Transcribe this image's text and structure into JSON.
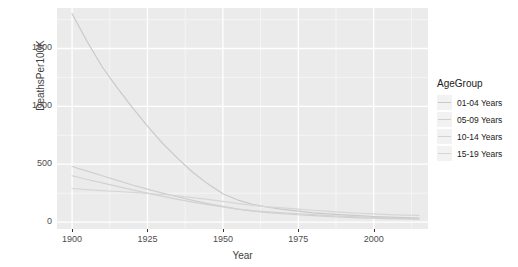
{
  "chart_data": {
    "type": "line",
    "title": "",
    "xlabel": "Year",
    "ylabel": "DeathsPer100K",
    "xlim": [
      1895,
      2018
    ],
    "ylim": [
      -60,
      1850
    ],
    "grid": true,
    "legend_position": "right",
    "legend_title": "AgeGroup",
    "xticks": [
      1900,
      1925,
      1950,
      1975,
      2000
    ],
    "yticks": [
      0,
      500,
      1000,
      1500
    ],
    "x": [
      1900,
      1905,
      1910,
      1915,
      1920,
      1925,
      1930,
      1935,
      1940,
      1945,
      1950,
      1955,
      1960,
      1965,
      1970,
      1975,
      1980,
      1985,
      1990,
      1995,
      2000,
      2005,
      2010,
      2015
    ],
    "series": [
      {
        "name": "01-04 Years",
        "color": "#c9c9c9",
        "values": [
          1800,
          1560,
          1340,
          1160,
          990,
          830,
          680,
          550,
          430,
          330,
          245,
          190,
          152,
          128,
          110,
          95,
          80,
          70,
          62,
          55,
          48,
          42,
          38,
          35
        ]
      },
      {
        "name": "05-09 Years",
        "color": "#cfcfcf",
        "values": [
          480,
          440,
          400,
          360,
          320,
          285,
          250,
          218,
          188,
          160,
          135,
          112,
          95,
          82,
          72,
          63,
          55,
          48,
          42,
          37,
          33,
          30,
          27,
          25
        ]
      },
      {
        "name": "10-14 Years",
        "color": "#d2d2d2",
        "values": [
          400,
          368,
          338,
          308,
          278,
          250,
          222,
          196,
          172,
          150,
          130,
          112,
          98,
          88,
          80,
          72,
          64,
          56,
          50,
          44,
          40,
          36,
          33,
          30
        ]
      },
      {
        "name": "15-19 Years",
        "color": "#d6d6d6",
        "values": [
          290,
          280,
          272,
          264,
          256,
          248,
          238,
          226,
          212,
          196,
          178,
          160,
          144,
          132,
          122,
          112,
          102,
          92,
          84,
          76,
          70,
          65,
          60,
          57
        ]
      }
    ]
  },
  "axis": {
    "y_title": "DeathsPer100K",
    "x_title": "Year",
    "y_tick_labels": [
      "1500",
      "1000",
      "500",
      "0"
    ],
    "x_tick_labels": [
      "1900",
      "1925",
      "1950",
      "1975",
      "2000"
    ]
  },
  "legend": {
    "title": "AgeGroup",
    "items": [
      {
        "label": "01-04 Years"
      },
      {
        "label": "05-09 Years"
      },
      {
        "label": "10-14 Years"
      },
      {
        "label": "15-19 Years"
      }
    ]
  },
  "colors": {
    "panel_background": "#ebebeb",
    "grid_major": "#ffffff",
    "grid_minor": "#f5f5f5",
    "text": "#4d4d4d",
    "page_background": "#ffffff"
  }
}
